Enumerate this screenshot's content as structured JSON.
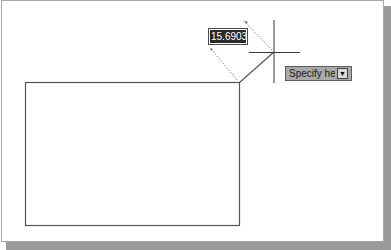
{
  "dynamic_input": {
    "dimension_value": "15.6903"
  },
  "tooltip": {
    "prompt_text": "Specify height or",
    "options_icon": "down-arrow-icon"
  },
  "drawing": {
    "rectangle": {
      "x": 25,
      "y": 82,
      "width": 214,
      "height": 143
    },
    "rubberband_line": {
      "x1": 239,
      "y1": 82,
      "x2": 274,
      "y2": 52
    },
    "crosshair": {
      "cx": 274,
      "cy": 52
    },
    "colors": {
      "geometry": "#555555",
      "crosshair": "#3a3a3a",
      "dimension": "#8a8a8a"
    }
  }
}
